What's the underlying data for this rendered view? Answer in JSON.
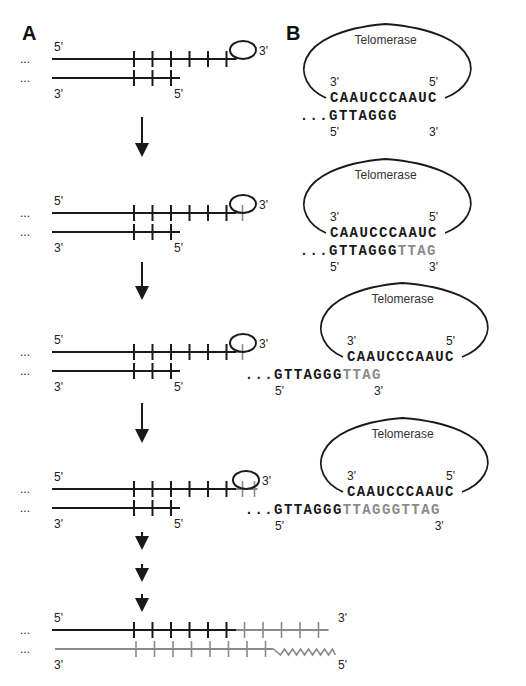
{
  "figure": {
    "panel_a_label": "A",
    "panel_b_label": "B",
    "colors": {
      "original_strand": "#1a1a1a",
      "new_strand": "#8a8a8a"
    }
  },
  "panel_a": {
    "ellipsis": "...",
    "stages": [
      {
        "top_left": "5'",
        "top_right": "3'",
        "bottom_left": "3'",
        "bottom_right": "5'",
        "top_black_repeats": 6,
        "top_grey_repeats": 0,
        "bottom_repeats": 3,
        "has_telomerase": true
      },
      {
        "top_left": "5'",
        "top_right": "3'",
        "bottom_left": "3'",
        "bottom_right": "5'",
        "top_black_repeats": 6,
        "top_grey_repeats": 1,
        "bottom_repeats": 3,
        "has_telomerase": true
      },
      {
        "top_left": "5'",
        "top_right": "3'",
        "bottom_left": "3'",
        "bottom_right": "5'",
        "top_black_repeats": 6,
        "top_grey_repeats": 1,
        "bottom_repeats": 3,
        "has_telomerase": true
      },
      {
        "top_left": "5'",
        "top_right": "3'",
        "bottom_left": "3'",
        "bottom_right": "5'",
        "top_black_repeats": 6,
        "top_grey_repeats": 2,
        "bottom_repeats": 3,
        "has_telomerase": true
      },
      {
        "top_left": "5'",
        "top_right": "3'",
        "bottom_left": "3'",
        "bottom_right": "5'",
        "top_black_repeats": 6,
        "top_grey_repeats": 5,
        "bottom_repeats": 8,
        "has_telomerase": false,
        "bottom_grey": true,
        "primer_zigzag": true
      }
    ]
  },
  "panel_b": {
    "steps": [
      {
        "enzyme": "Telomerase",
        "template_left": "3'",
        "template_right": "5'",
        "template_seq": "CAAUCCCAAUC",
        "dna_prefix": "...",
        "dna_black": "GTTAGGG",
        "dna_grey": "",
        "dna_left": "5'",
        "dna_right": "3'"
      },
      {
        "enzyme": "Telomerase",
        "template_left": "3'",
        "template_right": "5'",
        "template_seq": "CAAUCCCAAUC",
        "dna_prefix": "...",
        "dna_black": "GTTAGGG",
        "dna_grey": "TTAG",
        "dna_left": "5'",
        "dna_right": "3'"
      },
      {
        "enzyme": "Telomerase",
        "template_left": "3'",
        "template_right": "5'",
        "template_seq": "CAAUCCCAAUC",
        "dna_prefix": "...",
        "dna_black": "GTTAGGG",
        "dna_grey": "TTAG",
        "dna_left": "5'",
        "dna_right": "3'"
      },
      {
        "enzyme": "Telomerase",
        "template_left": "3'",
        "template_right": "5'",
        "template_seq": "CAAUCCCAAUC",
        "dna_prefix": "...",
        "dna_black": "GTTAGGG",
        "dna_grey": "TTAGGGTTAG",
        "dna_left": "5'",
        "dna_right": "3'"
      }
    ]
  }
}
